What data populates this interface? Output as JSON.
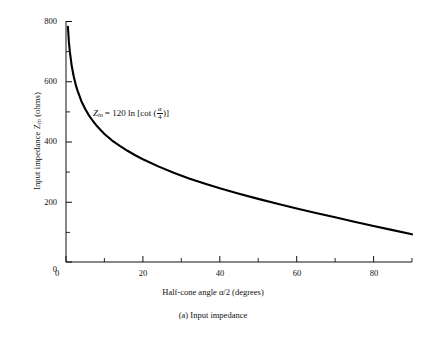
{
  "chart_data": {
    "type": "line",
    "title": "",
    "caption": "(a)  Input impedance",
    "xlabel": "Half-cone angle α/2 (degrees)",
    "ylabel": "Input impedance Z",
    "ylabel_sub": "in",
    "ylabel_units": " (ohms)",
    "xlim": [
      0,
      90
    ],
    "ylim": [
      0,
      800
    ],
    "grid": false,
    "legend": null,
    "annotation": {
      "text_lead": "Z",
      "text_sub": "in",
      "text_mid": "= 120 ln [cot (",
      "frac_num": "α",
      "frac_den": "4",
      "text_tail": ")]"
    },
    "xticks": [
      0,
      20,
      40,
      60,
      80
    ],
    "xtick_labels": [
      "0",
      "20",
      "40",
      "60",
      "80"
    ],
    "xminor_step": 10,
    "yticks": [
      0,
      200,
      400,
      600,
      800
    ],
    "ytick_labels": [
      "0",
      "200",
      "400",
      "600",
      "800"
    ],
    "yminor_step": 100,
    "series": [
      {
        "name": "Z_in = 120 ln[cot(alpha/4)]",
        "color": "#000000",
        "x": [
          0.5,
          0.75,
          1,
          1.5,
          2,
          2.5,
          3,
          4,
          5,
          6,
          7,
          8,
          9,
          10,
          12,
          14,
          16,
          18,
          20,
          24,
          28,
          32,
          36,
          40,
          45,
          50,
          55,
          60,
          65,
          70,
          75,
          80,
          85,
          90
        ],
        "y": [
          782,
          733,
          700,
          651,
          618,
          591,
          570,
          535,
          509,
          487,
          469,
          453,
          439,
          426,
          404,
          386,
          370,
          355,
          342,
          318,
          297,
          278,
          261,
          245,
          227,
          210,
          194,
          178,
          163,
          149,
          134,
          120,
          106,
          92
        ]
      }
    ],
    "curve_note": "Z_in(theta) = 120*ln(cot(theta/2)) with theta = half-cone angle alpha/2 in degrees"
  },
  "axes": {
    "x_axis_name": "x-axis",
    "y_axis_name": "y-axis"
  }
}
